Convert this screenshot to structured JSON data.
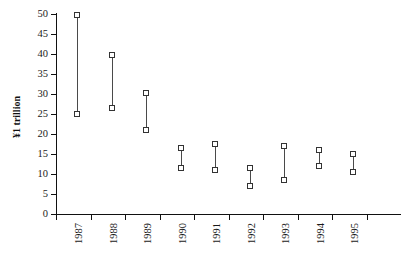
{
  "chart_data": {
    "type": "bar",
    "subtype": "high-low-range",
    "title": "",
    "subtitle": "",
    "xlabel": "",
    "ylabel": "¥1 trillion",
    "ylim": [
      0,
      50
    ],
    "yticks": [
      0,
      5,
      10,
      15,
      20,
      25,
      30,
      35,
      40,
      45,
      50
    ],
    "ytick_labels": [
      "0",
      "5",
      "10",
      "15",
      "20",
      "25",
      "30",
      "35",
      "40",
      "45",
      "50"
    ],
    "grid": false,
    "legend": null,
    "categories": [
      "1987",
      "1988",
      "1989",
      "1990",
      "1991",
      "1992",
      "1993",
      "1994",
      "1995"
    ],
    "series": [
      {
        "name": "High",
        "values": [
          49.8,
          39.8,
          30.2,
          16.5,
          17.5,
          11.5,
          17.0,
          16.0,
          15.0
        ]
      },
      {
        "name": "Low",
        "values": [
          25.0,
          26.5,
          21.0,
          11.5,
          11.0,
          7.0,
          8.5,
          12.0,
          10.5
        ]
      }
    ],
    "points": [
      {
        "category": "1987",
        "high": 49.8,
        "low": 25.0
      },
      {
        "category": "1988",
        "high": 39.8,
        "low": 26.5
      },
      {
        "category": "1989",
        "high": 30.2,
        "low": 21.0
      },
      {
        "category": "1990",
        "high": 16.5,
        "low": 11.5
      },
      {
        "category": "1991",
        "high": 17.5,
        "low": 11.0
      },
      {
        "category": "1992",
        "high": 11.5,
        "low": 7.0
      },
      {
        "category": "1993",
        "high": 17.0,
        "low": 8.5
      },
      {
        "category": "1994",
        "high": 16.0,
        "low": 12.0
      },
      {
        "category": "1995",
        "high": 15.0,
        "low": 10.5
      }
    ],
    "colors": {
      "axis": "#111111",
      "bar": "#4a4a4a",
      "marker_fill": "#ffffff",
      "marker_stroke": "#333333",
      "background": "#ffffff"
    }
  }
}
